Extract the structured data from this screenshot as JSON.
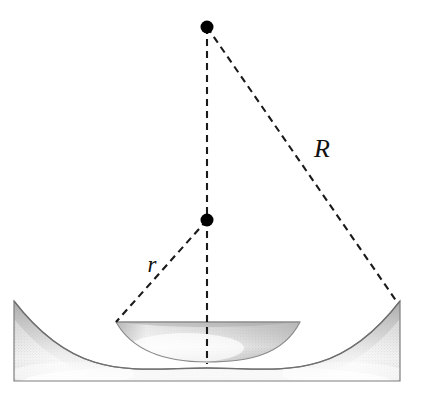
{
  "figure": {
    "background_color": "#ffffff",
    "width": 425,
    "height": 400,
    "labels": [
      {
        "id": "radius-large",
        "text": "R",
        "x": 322,
        "y": 157,
        "font_size": 26
      },
      {
        "id": "radius-small",
        "text": "r",
        "x": 152,
        "y": 272,
        "font_size": 23
      }
    ],
    "points": [
      {
        "id": "apex-point",
        "label": "",
        "x": 207,
        "y": 27,
        "radius": 6.5,
        "color": "#000000"
      },
      {
        "id": "center-point",
        "label": "",
        "x": 207,
        "y": 220,
        "radius": 6.5,
        "color": "#000000"
      }
    ],
    "dashed_lines": [
      {
        "id": "axis-line",
        "x1": 207,
        "y1": 27,
        "x2": 207,
        "y2": 364,
        "color": "#1a1a1a"
      },
      {
        "id": "radius-large-line",
        "x1": 207,
        "y1": 27,
        "x2": 397,
        "y2": 302,
        "color": "#1a1a1a"
      },
      {
        "id": "radius-small-line",
        "x1": 207,
        "y1": 220,
        "x2": 116,
        "y2": 322,
        "color": "#1a1a1a"
      }
    ],
    "block": {
      "id": "concave-block",
      "left": 14,
      "right": 400,
      "top": 301,
      "bottom": 381,
      "dip_depth": 67,
      "fill_light": "#fdfdfd",
      "fill_mid": "#d9d9d9",
      "fill_dark": "#c2c2c2",
      "stroke": "#7e7e7e"
    },
    "cap": {
      "id": "spherical-cap",
      "left": 116,
      "right": 300,
      "top": 322,
      "bottom": 362,
      "fill_light": "#fbfbfb",
      "fill_mid": "#d6d6d6",
      "stroke": "#8a8a8a"
    },
    "stroke_colors": {
      "outline": "#7e7e7e",
      "dash": "#1a1a1a",
      "dot": "#000000"
    },
    "dash_pattern": "7 5"
  }
}
